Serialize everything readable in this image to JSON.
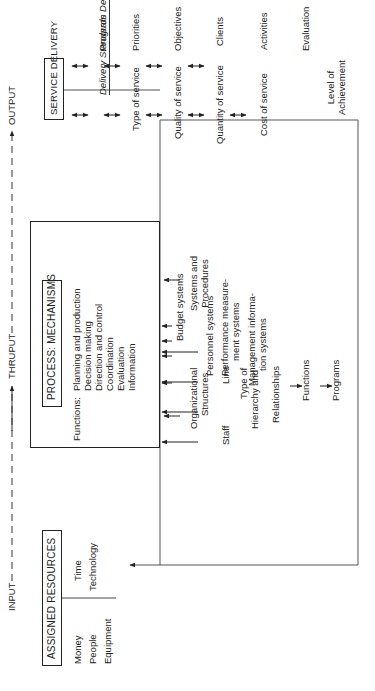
{
  "flow": {
    "input": "INPUT",
    "thruput": "THRUPUT",
    "output": "OUTPUT"
  },
  "assigned_resources": {
    "title": "ASSIGNED RESOURCES",
    "col1": [
      "Money",
      "People",
      "Equipment"
    ],
    "col2": [
      "Time",
      "Technology"
    ]
  },
  "process": {
    "title": "PROCESS: MECHANISMS",
    "functions_label": "Functions:",
    "functions": [
      "Planning and production",
      "Decision making",
      "Direction and control",
      "Coordination",
      "Evaluation",
      "Information"
    ]
  },
  "organizational_structures": {
    "title_line1": "Organizational",
    "title_line2": "Structures",
    "staff": "Staff",
    "line": "Line",
    "type_of": "Type of",
    "hierarchy_and": "Hierarchy and",
    "relationships": "Relationships",
    "functions": "Functions",
    "programs": "Programs"
  },
  "systems_procedures": {
    "title_line1": "Systems and",
    "title_line2": "Procedures",
    "items": [
      {
        "line1": "Budget systems",
        "line2": ""
      },
      {
        "line1": "Personnel systems",
        "line2": ""
      },
      {
        "line1": "Performance measure-",
        "line2": "ment systems"
      },
      {
        "line1": "Management informa-",
        "line2": "tion systems"
      }
    ]
  },
  "service_delivery": {
    "title": "SERVICE DELIVERY",
    "delivery_standards": {
      "heading": "Delivery Standards",
      "items": [
        "Type of service",
        "Quality of service",
        "Quantity of service",
        "Cost of service"
      ]
    },
    "program_definitions": {
      "heading": "Program Definitions",
      "items": [
        "Priorities",
        "Objectives",
        "Clients",
        "Activities",
        "Evaluation"
      ]
    },
    "level_line1": "Level of",
    "level_line2": "Achievement"
  },
  "colors": {
    "ink": "#222222",
    "background": "#ffffff"
  }
}
